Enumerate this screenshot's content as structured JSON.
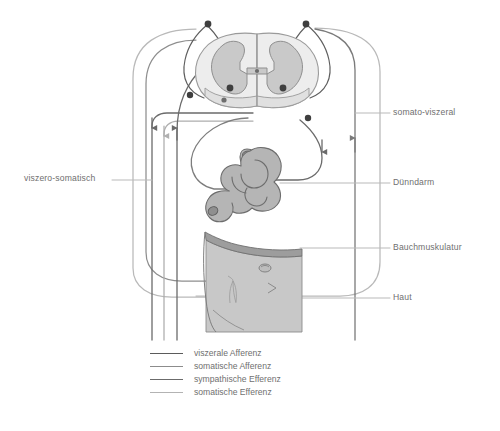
{
  "diagram": {
    "labels": {
      "left": [
        {
          "id": "viszero-somatisch",
          "text": "viszero-somatisch",
          "x": 24,
          "y": 178
        }
      ],
      "right": [
        {
          "id": "somato-viszeral",
          "text": "somato-viszeral",
          "x": 393,
          "y": 112
        },
        {
          "id": "duenndarm",
          "text": "Dünndarm",
          "x": 393,
          "y": 182
        },
        {
          "id": "bauchmuskulatur",
          "text": "Bauchmuskulatur",
          "x": 393,
          "y": 247
        },
        {
          "id": "haut",
          "text": "Haut",
          "x": 393,
          "y": 297
        }
      ]
    },
    "legend": {
      "items": [
        {
          "id": "viszerale-afferenz",
          "label": "viszerale Afferenz",
          "color": "#5b5b5b"
        },
        {
          "id": "somatische-afferenz",
          "label": "somatische Afferenz",
          "color": "#8c8c8c"
        },
        {
          "id": "sympathische-efferenz",
          "label": "sympathische Efferenz",
          "color": "#6b6b6b"
        },
        {
          "id": "somatische-efferenz",
          "label": "somatische Efferenz",
          "color": "#b3b3b3"
        }
      ]
    },
    "anatomy": {
      "spinal_cord": "spinal-cord-cross-section",
      "gray_matter": "butterfly-gray-matter",
      "intestine": "small-intestine-loops",
      "abdominal_wall": "abdominal-wall-skin-flap",
      "ganglia_count": 2
    },
    "colors": {
      "line_dark": "#5b5b5b",
      "line_mid": "#8c8c8c",
      "line_light": "#b3b3b3",
      "cord_fill": "#ededed",
      "cord_stroke": "#9a9a9a",
      "gray_matter": "#c9c9c9",
      "gray_matter_stroke": "#8f8f8f",
      "organ_fill": "#b8b8b8",
      "organ_stroke": "#6d6d6d",
      "skin_fill": "#c6c6c6",
      "muscle_fill": "#a5a5a5",
      "text": "#6f6f6f"
    }
  }
}
